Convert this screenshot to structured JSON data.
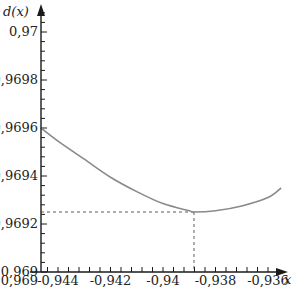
{
  "chart_data": {
    "type": "line",
    "title": "",
    "xlabel": "x",
    "ylabel": "d(x)",
    "xlim": [
      -0.94465,
      -0.9355
    ],
    "ylim": [
      0.969,
      0.9701
    ],
    "x_ticks": [
      -0.944,
      -0.942,
      -0.94,
      -0.938,
      -0.936
    ],
    "x_tick_labels": [
      "-0,944",
      "-0,942",
      "-0,94",
      "-0,938",
      "-0,936"
    ],
    "y_ticks": [
      0.969,
      0.9692,
      0.9694,
      0.9696,
      0.9698,
      0.97
    ],
    "y_tick_labels": [
      "0,969",
      "0,9692",
      "0,9694",
      "0,9696",
      "0,9698",
      "0,97"
    ],
    "x_minor_per_major": 5,
    "y_minor_per_major": 5,
    "grid": false,
    "series": [
      {
        "name": "d(x)",
        "color": "#8a8a8a",
        "x": [
          -0.94465,
          -0.944,
          -0.943,
          -0.942,
          -0.941,
          -0.94,
          -0.939,
          -0.93882,
          -0.938,
          -0.937,
          -0.936,
          -0.9355
        ],
        "y": [
          0.9696,
          0.969545,
          0.96947,
          0.969395,
          0.969335,
          0.969285,
          0.969255,
          0.96925,
          0.969255,
          0.969275,
          0.96931,
          0.96935
        ]
      }
    ],
    "annotations": [
      {
        "type": "dashed-guide",
        "x": -0.93882,
        "y": 0.96925,
        "description": "minimum point projected to axes"
      }
    ],
    "axis_colors": {
      "axis": "#1a1a1a",
      "curve": "#8a8a8a",
      "guide": "#333333"
    }
  }
}
